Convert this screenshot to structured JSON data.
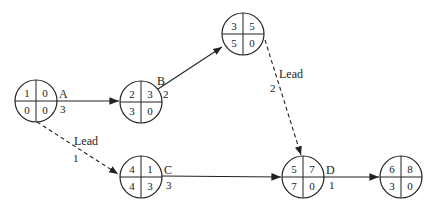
{
  "diagram": {
    "type": "precedence network (activity-on-node) with lead relationships",
    "nodes": [
      {
        "id": "n1",
        "cx": 36,
        "cy": 101,
        "tl": "1",
        "tr": "0",
        "bl": "0",
        "br": "0"
      },
      {
        "id": "n2",
        "cx": 141,
        "cy": 102,
        "tl": "2",
        "tr": "3",
        "bl": "3",
        "br": "0"
      },
      {
        "id": "n3",
        "cx": 243,
        "cy": 34,
        "tl": "3",
        "tr": "5",
        "bl": "5",
        "br": "0"
      },
      {
        "id": "n4",
        "cx": 141,
        "cy": 177,
        "tl": "4",
        "tr": "1",
        "bl": "4",
        "br": "3"
      },
      {
        "id": "n5",
        "cx": 303,
        "cy": 177,
        "tl": "5",
        "tr": "7",
        "bl": "7",
        "br": "0"
      },
      {
        "id": "n6",
        "cx": 401,
        "cy": 177,
        "tl": "6",
        "tr": "8",
        "bl": "3",
        "br": "0"
      }
    ],
    "activities": [
      {
        "name": "A",
        "duration": "3",
        "from": "n1",
        "to": "n2"
      },
      {
        "name": "B",
        "duration": "2",
        "from": "n2",
        "to": "n3"
      },
      {
        "name": "C",
        "duration": "3",
        "from": "n4",
        "to": "n5"
      },
      {
        "name": "D",
        "duration": "1",
        "from": "n5",
        "to": "n6"
      }
    ],
    "leads": [
      {
        "label": "Lead",
        "value": "1",
        "from": "n1",
        "to": "n4"
      },
      {
        "label": "Lead",
        "value": "2",
        "from": "n3",
        "to": "n5"
      }
    ]
  }
}
